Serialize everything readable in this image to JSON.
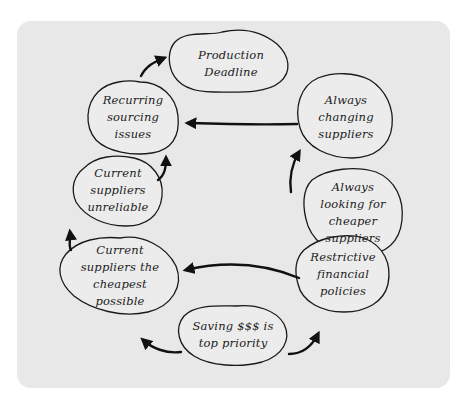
{
  "diagram": {
    "type": "cycle",
    "background_color": "#e8e8e8",
    "line_color": "#111111",
    "nodes": [
      {
        "id": "production-deadline",
        "label": "Production\nDeadline"
      },
      {
        "id": "always-changing-suppliers",
        "label": "Always\nchanging\nsuppliers"
      },
      {
        "id": "always-looking-cheaper",
        "label": "Always\nlooking for\ncheaper\nsuppliers"
      },
      {
        "id": "restrictive-financial-policies",
        "label": "Restrictive\nfinancial\npolicies"
      },
      {
        "id": "saving-top-priority",
        "label": "Saving $$$ is\ntop priority"
      },
      {
        "id": "current-cheapest",
        "label": "Current\nsuppliers the\ncheapest\npossible"
      },
      {
        "id": "current-unreliable",
        "label": "Current\nsuppliers\nunreliable"
      },
      {
        "id": "recurring-sourcing-issues",
        "label": "Recurring\nsourcing\nissues"
      }
    ],
    "edges": [
      {
        "from": "saving-top-priority",
        "to": "restrictive-financial-policies"
      },
      {
        "from": "saving-top-priority",
        "to": "current-cheapest"
      },
      {
        "from": "restrictive-financial-policies",
        "to": "current-cheapest"
      },
      {
        "from": "always-looking-cheaper",
        "to": "always-changing-suppliers"
      },
      {
        "from": "always-changing-suppliers",
        "to": "recurring-sourcing-issues"
      },
      {
        "from": "current-cheapest",
        "to": "current-unreliable"
      },
      {
        "from": "current-unreliable",
        "to": "recurring-sourcing-issues"
      },
      {
        "from": "recurring-sourcing-issues",
        "to": "production-deadline"
      }
    ]
  }
}
